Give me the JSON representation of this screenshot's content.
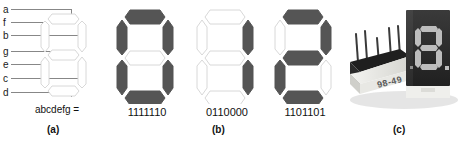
{
  "figure": {
    "background_color": "#ffffff"
  },
  "colors": {
    "segment_on": "#555555",
    "segment_off_fill": "#ffffff",
    "segment_off_stroke": "#d8d8d8",
    "leader_line": "#7a7a7a",
    "text": "#111111",
    "photo_body_dark": "#2b2b2b",
    "photo_body_light": "#ededea",
    "photo_pin": "#3a3a3a",
    "photo_lit_segment": "#b9b9b9"
  },
  "panel_a": {
    "tag": "(a)",
    "caption": "abcdefg =",
    "segment_labels": [
      {
        "id": "a",
        "label": "a"
      },
      {
        "id": "f",
        "label": "f"
      },
      {
        "id": "b",
        "label": "b"
      },
      {
        "id": "g",
        "label": "g"
      },
      {
        "id": "e",
        "label": "e"
      },
      {
        "id": "c",
        "label": "c"
      },
      {
        "id": "d",
        "label": "d"
      }
    ],
    "display": {
      "name": "segment-reference-display",
      "segments_on": []
    }
  },
  "panel_b": {
    "tag": "(b)",
    "digits": [
      {
        "name": "digit-zero",
        "code": "1111110",
        "glyph": "0",
        "segments_on": [
          "a",
          "b",
          "c",
          "d",
          "e",
          "f"
        ]
      },
      {
        "name": "digit-one",
        "code": "0110000",
        "glyph": "1",
        "segments_on": [
          "b",
          "c"
        ]
      },
      {
        "name": "digit-two",
        "code": "1101101",
        "glyph": "2",
        "segments_on": [
          "a",
          "b",
          "g",
          "e",
          "d"
        ]
      }
    ]
  },
  "panel_c": {
    "tag": "(c)",
    "description": "Photograph of two seven-segment LED display packages",
    "part_marking": "98-49",
    "displayed_glyph": "8",
    "has_decimal_point": true
  }
}
